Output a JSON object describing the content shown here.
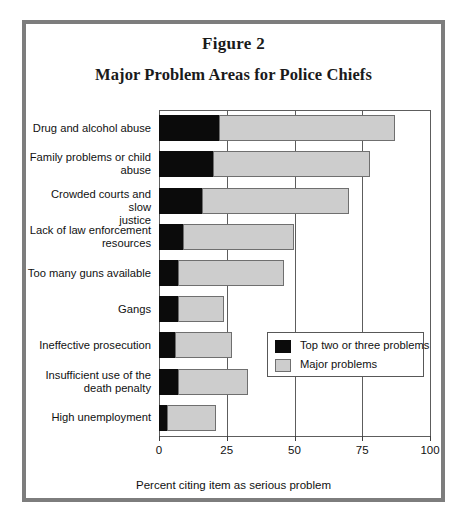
{
  "figure": {
    "number": "Figure 2",
    "title": "Major Problem Areas for Police Chiefs"
  },
  "legend": {
    "position": "inside-right-middle",
    "entries": [
      {
        "label": "Top two or three problems",
        "color": "#0b0b0b",
        "key": "top_two_or_three"
      },
      {
        "label": "Major problems",
        "color": "#cdcdcd",
        "key": "major"
      }
    ]
  },
  "axis": {
    "x_title": "Percent citing item as serious problem",
    "x_ticks": [
      "0",
      "25",
      "50",
      "75",
      "100"
    ]
  },
  "chart_data": {
    "type": "bar",
    "orientation": "horizontal",
    "stacked": true,
    "title": "Major Problem Areas for Police Chiefs",
    "subtitle": "Figure 2",
    "xlabel": "Percent citing item as serious problem",
    "ylabel": "",
    "xlim": [
      0,
      100
    ],
    "xticks": [
      0,
      25,
      50,
      75,
      100
    ],
    "grid": true,
    "legend": [
      "Top two or three problems",
      "Major problems"
    ],
    "legend_position": "inside-right-middle",
    "categories": [
      "Drug and alcohol abuse",
      "Family problems or child abuse",
      "Crowded courts and slow justice",
      "Lack of law enforcement resources",
      "Too many guns available",
      "Gangs",
      "Ineffective prosecution",
      "Insufficient use of the death penalty",
      "High unemployment"
    ],
    "series": [
      {
        "name": "Top two or three problems",
        "color": "#0b0b0b",
        "values": [
          22,
          20,
          16,
          9,
          7,
          7,
          6,
          7,
          3
        ]
      },
      {
        "name": "Major problems",
        "color": "#cdcdcd",
        "values": [
          65,
          58,
          54,
          41,
          39,
          17,
          21,
          26,
          18
        ]
      }
    ],
    "totals": [
      87,
      78,
      70,
      50,
      46,
      24,
      27,
      33,
      21
    ]
  },
  "categories_display": [
    "Drug and alcohol abuse",
    "Family problems or child\nabuse",
    "Crowded courts and slow\njustice",
    "Lack of law enforcement\nresources",
    "Too many guns available",
    "Gangs",
    "Ineffective prosecution",
    "Insufficient use of the\ndeath penalty",
    "High unemployment"
  ]
}
